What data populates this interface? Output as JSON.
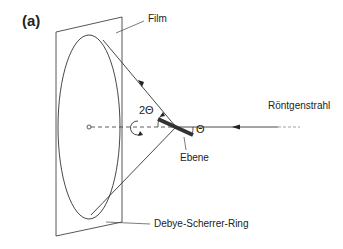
{
  "figure": {
    "panel_label": "(a)",
    "labels": {
      "film": "Film",
      "xray_beam": "Röntgenstrahl",
      "plane": "Ebene",
      "ring": "Debye-Scherrer-Ring",
      "two_theta": "2Θ",
      "theta": "Θ"
    },
    "colors": {
      "line": "#333333",
      "crystal_plane": "#333333",
      "text": "#222222"
    }
  }
}
